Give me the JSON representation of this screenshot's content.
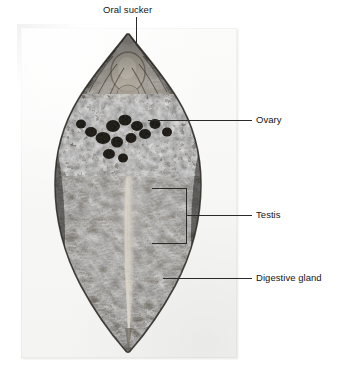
{
  "figure": {
    "type": "anatomical-photomicrograph",
    "background_color": "#ffffff",
    "plate_color": "#f6f6f4",
    "leader_line_color": "#2a2a2a",
    "label_text_color": "#151515"
  },
  "labels": {
    "oral_sucker": "Oral sucker",
    "ovary": "Ovary",
    "testis": "Testis",
    "digestive_gland": "Digestive gland"
  },
  "callouts": [
    {
      "name": "oral-sucker",
      "label": "Oral sucker",
      "position": "top-center",
      "leader": "vertical"
    },
    {
      "name": "ovary",
      "label": "Ovary",
      "position": "right-upper",
      "leader": "horizontal"
    },
    {
      "name": "testis",
      "label": "Testis",
      "position": "right-middle",
      "leader": "bracket"
    },
    {
      "name": "digestive-gland",
      "label": "Digestive gland",
      "position": "right-lower",
      "leader": "horizontal"
    }
  ]
}
